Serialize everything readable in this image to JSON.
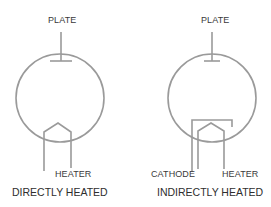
{
  "diagram": {
    "stroke_color": "#9a9a9a",
    "text_color": "#333333",
    "tubes": [
      {
        "id": "directly-heated",
        "caption": "DIRECTLY HEATED",
        "labels": {
          "plate": "PLATE",
          "heater": "HEATER"
        }
      },
      {
        "id": "indirectly-heated",
        "caption": "INDIRECTLY HEATED",
        "labels": {
          "plate": "PLATE",
          "cathode": "CATHODE",
          "heater": "HEATER"
        }
      }
    ]
  }
}
